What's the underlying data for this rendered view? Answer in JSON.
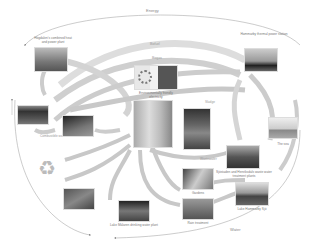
{
  "diagram": {
    "outer_flows": {
      "top": "Energy",
      "bottom": "Water"
    },
    "inner_flows": [
      "Biofuel",
      "Biogas",
      "Biogas",
      "Sludge",
      "Food waste",
      "Nutrients",
      "Heat",
      "Wastewater",
      "Combustible waste",
      "Recyclables",
      "Compost"
    ],
    "nodes": [
      {
        "id": "cogen",
        "label": "Högdalen's combined heat and power plant"
      },
      {
        "id": "env-buildings",
        "label": "Environmentally friendly electricity"
      },
      {
        "id": "hammarby-plant",
        "label": "Hammarby thermal power station"
      },
      {
        "id": "district",
        "label": "Residential building"
      },
      {
        "id": "bus",
        "label": "Biogas vehicles"
      },
      {
        "id": "sea",
        "label": "The sea"
      },
      {
        "id": "treatment",
        "label": "Sjöstaden and Henriksdals waste water treatment plants"
      },
      {
        "id": "lake",
        "label": "Lake Hammarby Sjö"
      },
      {
        "id": "gardens",
        "label": "Gardens"
      },
      {
        "id": "rain",
        "label": "Rain treatment"
      },
      {
        "id": "water-plant",
        "label": "Lake Mälaren drinking water plant"
      },
      {
        "id": "recycle",
        "label": "Recycling"
      },
      {
        "id": "field",
        "label": "Farmland"
      },
      {
        "id": "landfill",
        "label": "Compost"
      },
      {
        "id": "waste",
        "label": "Waste"
      }
    ],
    "colors": {
      "arrow": "#c8c8c8",
      "arrow_dark": "#a9a9a9",
      "outline": "#999999"
    }
  }
}
